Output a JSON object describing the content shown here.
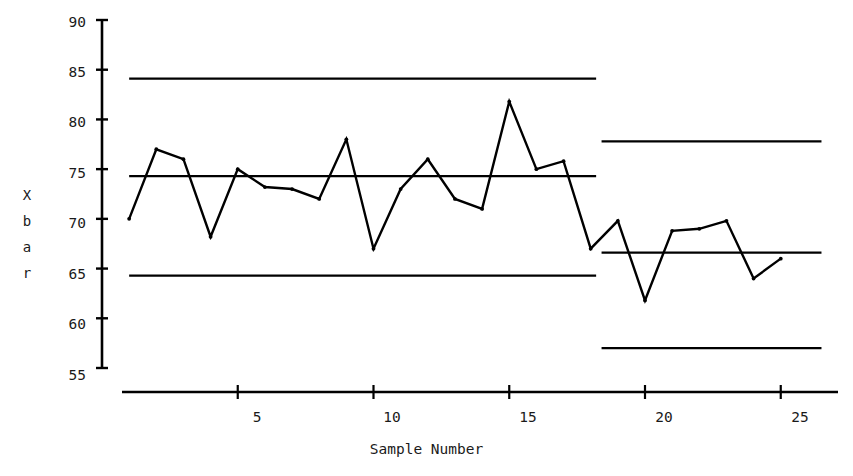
{
  "chart_data": {
    "type": "line",
    "title": "",
    "xlabel": "Sample Number",
    "ylabel": "X bar",
    "ylabel_chars": [
      "X",
      "b",
      "a",
      "r"
    ],
    "xlim": [
      0,
      26.8
    ],
    "ylim": [
      55,
      90
    ],
    "grid": false,
    "legend": "none",
    "x_ticks": [
      5,
      10,
      15,
      20,
      25
    ],
    "x_tick_labels": [
      "5",
      "10",
      "15",
      "20",
      "25"
    ],
    "y_ticks": [
      55,
      60,
      65,
      70,
      75,
      80,
      85,
      90
    ],
    "y_tick_labels": [
      "55",
      "60",
      "65",
      "70",
      "75",
      "80",
      "85",
      "90"
    ],
    "x": [
      1,
      2,
      3,
      4,
      5,
      6,
      7,
      8,
      9,
      10,
      11,
      12,
      13,
      14,
      15,
      16,
      17,
      18,
      19,
      20,
      21,
      22,
      23,
      24,
      25
    ],
    "series": [
      {
        "name": "X bar",
        "values": [
          70.0,
          77.0,
          76.0,
          68.2,
          75.0,
          73.2,
          73.0,
          72.0,
          78.0,
          67.0,
          73.0,
          76.0,
          72.0,
          71.0,
          81.8,
          75.0,
          75.8,
          67.0,
          69.8,
          61.8,
          68.8,
          69.0,
          69.8,
          64.0,
          66.0
        ],
        "color": "#000000",
        "marker": "dot"
      }
    ],
    "control_limits": [
      {
        "name": "UCL-phase-1",
        "value": 84.1,
        "x_start": 1,
        "x_end": 18.2,
        "color": "#000000"
      },
      {
        "name": "CL-phase-1",
        "value": 74.3,
        "x_start": 1,
        "x_end": 18.2,
        "color": "#000000"
      },
      {
        "name": "LCL-phase-1",
        "value": 64.3,
        "x_start": 1,
        "x_end": 18.2,
        "color": "#000000"
      },
      {
        "name": "UCL-phase-2",
        "value": 77.8,
        "x_start": 18.4,
        "x_end": 26.5,
        "color": "#000000"
      },
      {
        "name": "CL-phase-2",
        "value": 66.6,
        "x_start": 18.4,
        "x_end": 26.5,
        "color": "#000000"
      },
      {
        "name": "LCL-phase-2",
        "value": 57.0,
        "x_start": 18.4,
        "x_end": 26.5,
        "color": "#000000"
      }
    ]
  },
  "axis": {
    "ylabel_chars": [
      "X",
      "b",
      "a",
      "r"
    ],
    "xlabel": "Sample Number",
    "y_tick_labels": [
      "90",
      "85",
      "80",
      "75",
      "70",
      "65",
      "60",
      "55"
    ],
    "x_tick_labels": [
      "5",
      "10",
      "15",
      "20",
      "25"
    ]
  }
}
